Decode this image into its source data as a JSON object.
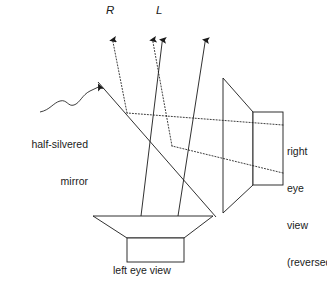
{
  "figure": {
    "width": 327,
    "height": 281,
    "background_color": "#ffffff",
    "line_color": "#1a1a1a",
    "text_color": "#1a1a1a"
  },
  "labels": {
    "ray_right": "R",
    "ray_left": "L",
    "mirror_line1": "half-silvered",
    "mirror_line2": "mirror",
    "right_eye_line1": "right",
    "right_eye_line2": "eye",
    "right_eye_line3": "view",
    "right_eye_line4": "(reversed)",
    "left_eye": "left eye view"
  },
  "diagram": {
    "mirror": {
      "name": "half-silvered-mirror",
      "style": "solid",
      "x1": 98,
      "y1": 82,
      "x2": 216,
      "y2": 217
    },
    "bottom_monitor": {
      "name": "left-eye-view-monitor",
      "screen_top_left": [
        93,
        216
      ],
      "screen_top_right": [
        213,
        216
      ],
      "screen_bottom_left": [
        127,
        238
      ],
      "screen_bottom_right": [
        184,
        238
      ],
      "base_rect": [
        127,
        238,
        57,
        24
      ]
    },
    "right_monitor": {
      "name": "right-eye-view-monitor",
      "screen_top_left": [
        223,
        78
      ],
      "screen_bottom_left": [
        223,
        213
      ],
      "screen_top_right": [
        253,
        112
      ],
      "screen_bottom_right": [
        253,
        185
      ],
      "base_rect": [
        253,
        112,
        30,
        73
      ]
    },
    "solid_rays": [
      {
        "name": "solid-ray-L",
        "x1": 141,
        "y1": 216,
        "x2": 162,
        "y2": 36
      },
      {
        "name": "solid-ray-R",
        "x1": 178,
        "y1": 216,
        "x2": 205,
        "y2": 36
      }
    ],
    "dotted_rays": [
      {
        "name": "dotted-ray-upper-in",
        "x1": 283,
        "y1": 125,
        "x2": 127,
        "y2": 113
      },
      {
        "name": "dotted-ray-upper-out",
        "x1": 127,
        "y1": 113,
        "x2": 112,
        "y2": 36
      },
      {
        "name": "dotted-ray-lower-in",
        "x1": 283,
        "y1": 173,
        "x2": 172,
        "y2": 146
      },
      {
        "name": "dotted-ray-lower-out",
        "x1": 172,
        "y1": 146,
        "x2": 152,
        "y2": 36
      }
    ],
    "arrows": [
      {
        "name": "arrow-dotted-left",
        "x": 112,
        "y": 33,
        "style": "dotted"
      },
      {
        "name": "arrow-dotted-right",
        "x": 152,
        "y": 33,
        "style": "dotted"
      },
      {
        "name": "arrow-solid-left",
        "x": 162,
        "y": 33,
        "style": "solid"
      },
      {
        "name": "arrow-solid-right",
        "x": 205,
        "y": 33,
        "style": "solid"
      }
    ],
    "pointer": {
      "name": "mirror-callout-pointer",
      "from": [
        44,
        110
      ],
      "to": [
        99,
        86
      ]
    }
  }
}
